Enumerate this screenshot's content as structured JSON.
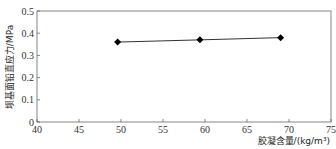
{
  "chart_data": {
    "type": "line",
    "title": "",
    "xlabel": "胶凝含量/(kg/m³)",
    "ylabel": "坝基面铅直应力/MPa",
    "xlim": [
      40,
      75
    ],
    "ylim": [
      0,
      0.5
    ],
    "xticks": [
      40,
      45,
      50,
      55,
      60,
      65,
      70,
      75
    ],
    "yticks": [
      0,
      0.1,
      0.2,
      0.3,
      0.4,
      0.5
    ],
    "xtick_labels": [
      "40",
      "45",
      "50",
      "55",
      "60",
      "65",
      "70",
      "75"
    ],
    "ytick_labels": [
      "0",
      "0.1",
      "0.2",
      "0.3",
      "0.4",
      "0.5"
    ],
    "grid": false,
    "legend": null,
    "series": [
      {
        "name": "坝基面铅直应力",
        "marker": "diamond",
        "color": "#000000",
        "x": [
          49.6,
          59.4,
          69.0
        ],
        "values": [
          0.36,
          0.37,
          0.38
        ]
      }
    ]
  }
}
